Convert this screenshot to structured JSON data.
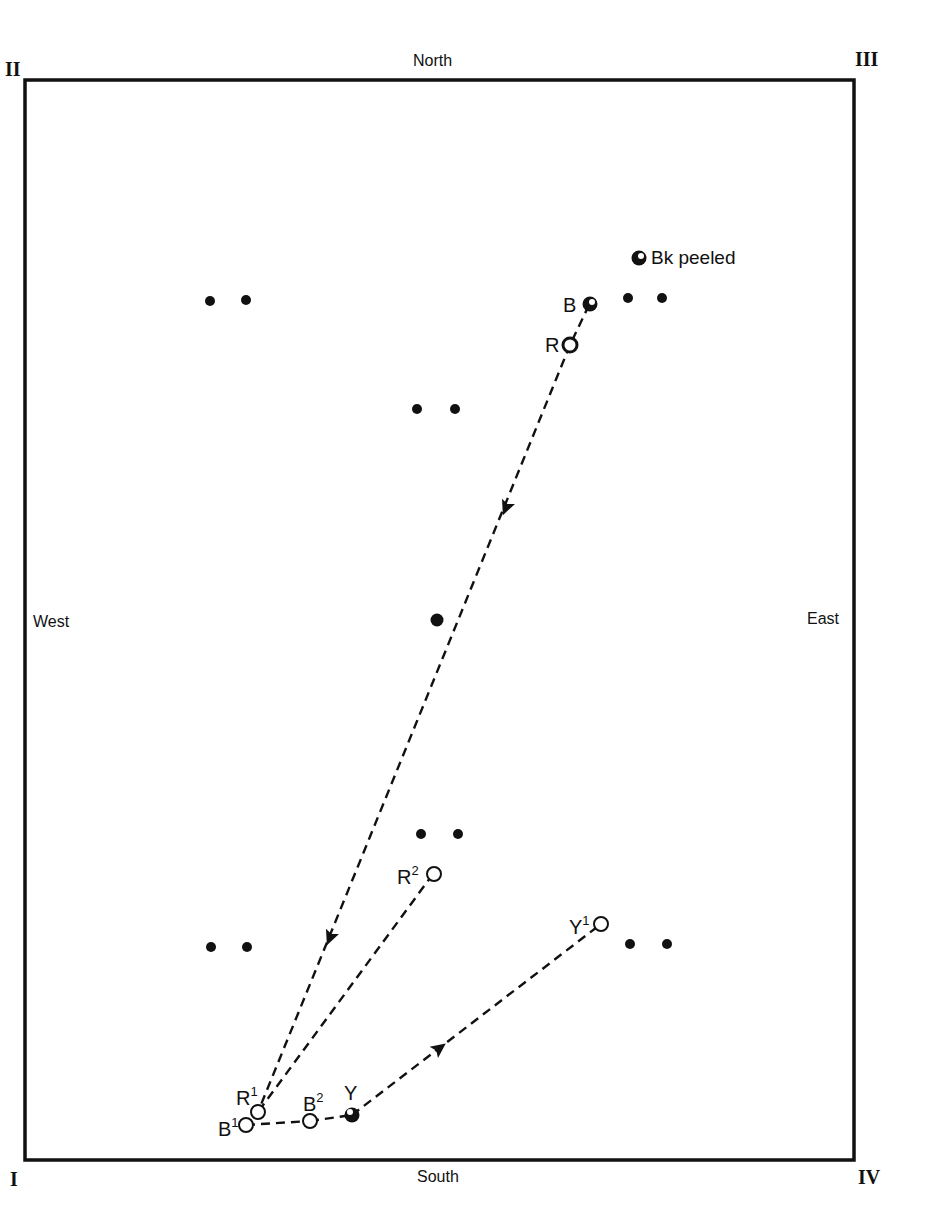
{
  "diagram": {
    "directions": {
      "north": "North",
      "south": "South",
      "east": "East",
      "west": "West"
    },
    "corners": {
      "top_left": "II",
      "top_right": "III",
      "bottom_left": "I",
      "bottom_right": "IV"
    },
    "legend": {
      "label": "Bk peeled"
    },
    "points": {
      "B": {
        "base": "B",
        "sup": ""
      },
      "R": {
        "base": "R",
        "sup": ""
      },
      "R1": {
        "base": "R",
        "sup": "1"
      },
      "B1": {
        "base": "B",
        "sup": "1"
      },
      "B2": {
        "base": "B",
        "sup": "2"
      },
      "Y": {
        "base": "Y",
        "sup": ""
      },
      "R2": {
        "base": "R",
        "sup": "2"
      },
      "Y1": {
        "base": "Y",
        "sup": "1"
      }
    },
    "colors": {
      "ink": "#111111",
      "background": "#ffffff"
    }
  }
}
